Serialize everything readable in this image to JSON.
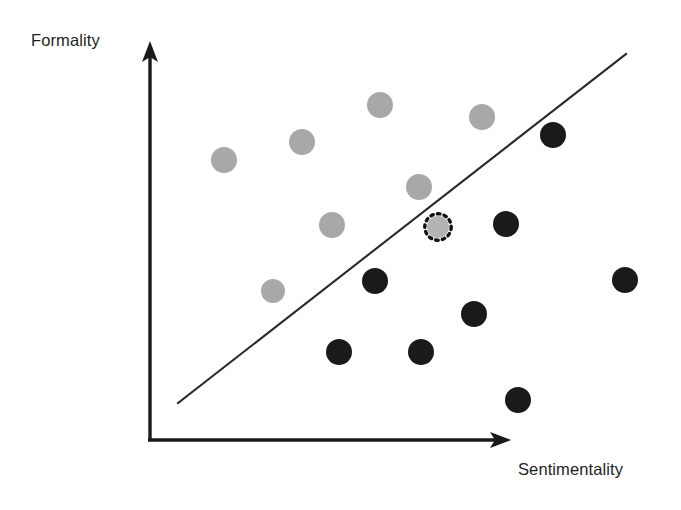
{
  "figure": {
    "background_color": "#ffffff"
  },
  "axes": {
    "y_label": "Formality",
    "x_label": "Sentimentality",
    "axis_color": "#1a1a1a"
  },
  "legend_colors": {
    "class_a_gray": "#a8a8a8",
    "class_b_dark": "#1a1a1a",
    "query_point_fill": "#b4b4b4",
    "query_point_ring": "#111111",
    "boundary": "#2b2b2b"
  },
  "chart_data": {
    "type": "scatter",
    "title": "",
    "xlabel": "Sentimentality",
    "ylabel": "Formality",
    "xlim": [
      0,
      1
    ],
    "ylim": [
      0,
      1
    ],
    "grid": false,
    "legend": "none",
    "annotations": [
      {
        "name": "decision-boundary",
        "type": "line",
        "description": "Linear decision boundary separating the two classes",
        "x0": 0.083,
        "y0": 0.093,
        "x1": 1.318,
        "y1": 0.968
      }
    ],
    "series": [
      {
        "name": "class-gray",
        "color": "#a8a8a8",
        "marker": "circle",
        "points": [
          {
            "x": 0.21,
            "y": 0.704,
            "px": 224,
            "py": 160,
            "r": 13
          },
          {
            "x": 0.425,
            "y": 0.75,
            "px": 302,
            "py": 142,
            "r": 13
          },
          {
            "x": 0.641,
            "y": 0.843,
            "px": 380,
            "py": 105,
            "r": 13
          },
          {
            "x": 0.922,
            "y": 0.812,
            "px": 482,
            "py": 117,
            "r": 13
          },
          {
            "x": 0.745,
            "y": 0.636,
            "px": 419,
            "py": 187,
            "r": 13
          },
          {
            "x": 0.505,
            "y": 0.54,
            "px": 332,
            "py": 225,
            "r": 13
          },
          {
            "x": 0.345,
            "y": 0.374,
            "px": 273,
            "py": 291,
            "r": 12
          }
        ]
      },
      {
        "name": "class-dark",
        "color": "#1a1a1a",
        "marker": "circle",
        "points": [
          {
            "x": 1.118,
            "y": 0.767,
            "px": 553,
            "py": 135,
            "r": 13
          },
          {
            "x": 0.979,
            "y": 0.563,
            "px": 506,
            "py": 224,
            "r": 13
          },
          {
            "x": 1.316,
            "y": 0.422,
            "px": 625,
            "py": 280,
            "r": 13
          },
          {
            "x": 0.634,
            "y": 0.4,
            "px": 375,
            "py": 281,
            "r": 13
          },
          {
            "x": 0.894,
            "y": 0.323,
            "px": 474,
            "py": 314,
            "r": 13
          },
          {
            "x": 0.54,
            "y": 0.224,
            "px": 339,
            "py": 352,
            "r": 13
          },
          {
            "x": 0.772,
            "y": 0.224,
            "px": 421,
            "py": 352,
            "r": 13
          },
          {
            "x": 1.018,
            "y": 0.101,
            "px": 518,
            "py": 400,
            "r": 13
          }
        ]
      },
      {
        "name": "query-point",
        "color": "#b4b4b4",
        "marker": "dotted-circle",
        "points": [
          {
            "x": 0.763,
            "y": 0.538,
            "px": 438,
            "py": 227,
            "r": 11
          }
        ]
      }
    ]
  }
}
